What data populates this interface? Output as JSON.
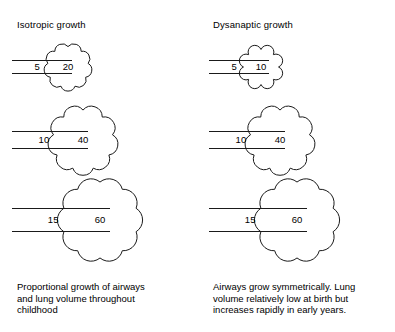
{
  "figure": {
    "type": "diagram",
    "background_color": "#ffffff",
    "stroke_color": "#1a1a1a"
  },
  "panels": [
    {
      "key": "isotropic",
      "title": "Isotropic growth",
      "caption_lines": [
        "Proportional growth of airways",
        "and lung volume throughout",
        "childhood"
      ],
      "stages": [
        {
          "airway": "5",
          "volume": "20",
          "airway_width": 60,
          "airway_gap": 13,
          "lung_size": 56
        },
        {
          "airway": "10",
          "volume": "40",
          "airway_width": 76,
          "airway_gap": 17,
          "lung_size": 82
        },
        {
          "airway": "15",
          "volume": "60",
          "airway_width": 98,
          "airway_gap": 23,
          "lung_size": 104
        }
      ]
    },
    {
      "key": "dysanaptic",
      "title": "Dysanaptic growth",
      "caption_lines": [
        "Airways grow symmetrically.  Lung",
        "volume relatively low at birth but",
        "increases rapidly in early years."
      ],
      "stages": [
        {
          "airway": "5",
          "volume": "10",
          "airway_width": 60,
          "airway_gap": 13,
          "lung_size": 48
        },
        {
          "airway": "10",
          "volume": "40",
          "airway_width": 76,
          "airway_gap": 17,
          "lung_size": 82
        },
        {
          "airway": "15",
          "volume": "60",
          "airway_width": 98,
          "airway_gap": 23,
          "lung_size": 104
        }
      ]
    }
  ],
  "chart_data": {
    "type": "table",
    "columns": [
      "growth pattern",
      "stage",
      "airway",
      "lung volume"
    ],
    "rows": [
      [
        "Isotropic growth",
        1,
        5,
        20
      ],
      [
        "Isotropic growth",
        2,
        10,
        40
      ],
      [
        "Isotropic growth",
        3,
        15,
        60
      ],
      [
        "Dysanaptic growth",
        1,
        5,
        10
      ],
      [
        "Dysanaptic growth",
        2,
        10,
        40
      ],
      [
        "Dysanaptic growth",
        3,
        15,
        60
      ]
    ]
  }
}
